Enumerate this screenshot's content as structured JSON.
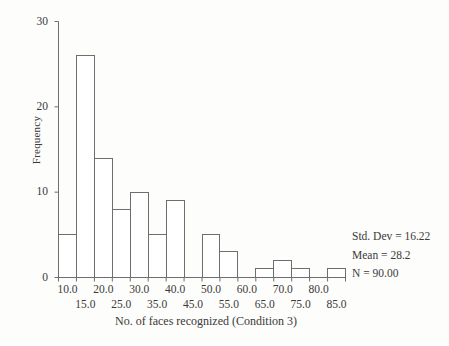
{
  "chart_data": {
    "type": "bar",
    "title": "",
    "subtitle": "",
    "xlabel": "No. of faces recognized (Condition 3)",
    "ylabel": "Frequency",
    "grid": false,
    "legend": "none",
    "bin_width": 5,
    "bin_starts": [
      7.5,
      12.5,
      17.5,
      22.5,
      27.5,
      32.5,
      37.5,
      42.5,
      47.5,
      52.5,
      57.5,
      62.5,
      67.5,
      72.5,
      77.5,
      82.5
    ],
    "bin_centers": [
      10,
      15,
      20,
      25,
      30,
      35,
      40,
      45,
      50,
      55,
      60,
      65,
      70,
      75,
      80,
      85
    ],
    "categories": [
      "10.0",
      "15.0",
      "20.0",
      "25.0",
      "30.0",
      "35.0",
      "40.0",
      "45.0",
      "50.0",
      "55.0",
      "60.0",
      "65.0",
      "70.0",
      "75.0",
      "80.0",
      "85.0"
    ],
    "values": [
      5,
      26,
      14,
      8,
      10,
      5,
      9,
      0,
      5,
      3,
      0,
      1,
      2,
      1,
      0,
      1
    ],
    "xlim": [
      7.5,
      87.5
    ],
    "ylim": [
      0,
      30
    ],
    "ytick_values": [
      0,
      10,
      20,
      30
    ],
    "ytick_labels": [
      "0",
      "10",
      "20",
      "30"
    ],
    "xtick_labels_upper": [
      "10.0",
      "20.0",
      "30.0",
      "40.0",
      "50.0",
      "60.0",
      "70.0",
      "80.0"
    ],
    "xtick_labels_lower": [
      "15.0",
      "25.0",
      "35.0",
      "45.0",
      "55.0",
      "65.0",
      "75.0",
      "85.0"
    ],
    "bar_fill": "#ffffff",
    "bar_stroke": "#6e6e6e",
    "axis_color": "#6e6e6e",
    "text_color": "#3a3a3a",
    "background": "#fdfdfb"
  },
  "annotations": {
    "std_dev": "Std. Dev = 16.22",
    "mean": "Mean = 28.2",
    "n": "N = 90.00"
  }
}
